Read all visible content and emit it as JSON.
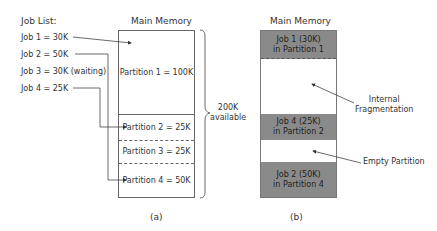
{
  "job_list": {
    "title": "Job List:",
    "jobs": [
      "Job 1 = 30K",
      "Job 2 = 50K",
      "Job 3 = 30K (waiting)",
      "Job 4 = 25K"
    ]
  },
  "diagram_a": {
    "title": "Main Memory",
    "partitions": [
      "Partition 1 = 100K",
      "Partition 2 = 25K",
      "Partition 3 = 25K",
      "Partition 4 = 50K"
    ],
    "brace_label_line1": "200K",
    "brace_label_line2": "available",
    "caption": "(a)"
  },
  "diagram_b": {
    "title": "Main Memory",
    "segments": [
      {
        "line1": "Job 1 (30K)",
        "line2": "in Partition 1"
      },
      {
        "line1": "",
        "line2": ""
      },
      {
        "line1": "Job 4 (25K)",
        "line2": "in Partition 2"
      },
      {
        "line1": "",
        "line2": ""
      },
      {
        "line1": "Job 2 (50K)",
        "line2": "in Partition 4"
      }
    ],
    "annotation_internal_line1": "Internal",
    "annotation_internal_line2": "Fragmentation",
    "annotation_empty": "Empty Partition",
    "caption": "(b)"
  },
  "colors": {
    "occupied": "#8a8a8a",
    "line": "#666666"
  }
}
